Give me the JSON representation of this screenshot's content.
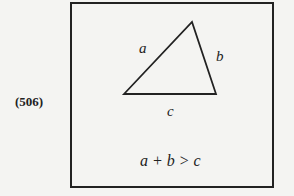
{
  "figure_number": "(506)",
  "triangle": {
    "side_labels": {
      "a": "a",
      "b": "b",
      "c": "c"
    },
    "vertices": [
      [
        124,
        94
      ],
      [
        192,
        22
      ],
      [
        216,
        94
      ]
    ]
  },
  "inequality": "a + b > c"
}
